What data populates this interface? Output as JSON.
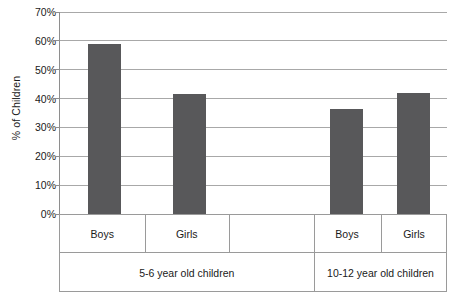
{
  "chart_data": {
    "type": "bar",
    "title": "",
    "xlabel": "",
    "ylabel": "% of Children",
    "ylim": [
      0,
      70
    ],
    "ytick_values": [
      0,
      10,
      20,
      30,
      40,
      50,
      60,
      70
    ],
    "ytick_labels": [
      "0%",
      "10%",
      "20%",
      "30%",
      "40%",
      "50%",
      "60%",
      "70%"
    ],
    "grid": true,
    "legend": null,
    "bar_color": "#58585a",
    "grid_color": "#a8a8a8",
    "axis_color": "#8e8e8e",
    "categories": [
      "Boys",
      "Girls",
      "",
      "Boys",
      "Girls"
    ],
    "values": [
      59,
      41.5,
      null,
      36.5,
      42
    ],
    "groups": [
      {
        "label": "5-6 year old children",
        "series": [
          {
            "category": "Boys",
            "value": 59
          },
          {
            "category": "Girls",
            "value": 41.5
          }
        ]
      },
      {
        "label": "10-12 year old children",
        "series": [
          {
            "category": "Boys",
            "value": 36.5
          },
          {
            "category": "Girls",
            "value": 42
          }
        ]
      }
    ],
    "group_labels": [
      "5-6 year old children",
      "10-12 year old children"
    ]
  },
  "axis_table": {
    "category_cells": [
      {
        "label": "Boys",
        "left": 0,
        "width": 84.5
      },
      {
        "label": "Girls",
        "left": 84.5,
        "width": 84.5
      },
      {
        "label": "",
        "left": 169,
        "width": 84.5
      },
      {
        "label": "Boys",
        "left": 253.5,
        "width": 67
      },
      {
        "label": "Girls",
        "left": 320.5,
        "width": 67
      }
    ],
    "group_cells": [
      {
        "label": "5-6 year old children",
        "left": 0,
        "width": 253.5
      },
      {
        "label": "10-12 year old children",
        "left": 253.5,
        "width": 134
      }
    ]
  },
  "bars": [
    {
      "name": "boys-5-6",
      "left": 29,
      "width": 33,
      "value": 59
    },
    {
      "name": "girls-5-6",
      "left": 114,
      "width": 33,
      "value": 41.5
    },
    {
      "name": "boys-10-12",
      "left": 270.5,
      "width": 33,
      "value": 36.5
    },
    {
      "name": "girls-10-12",
      "left": 337.5,
      "width": 33,
      "value": 42
    }
  ]
}
